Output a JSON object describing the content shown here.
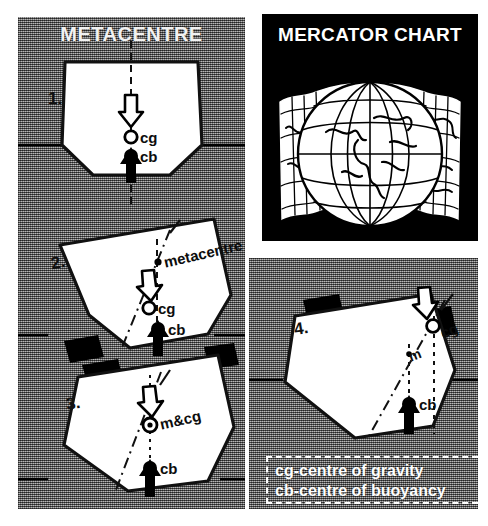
{
  "figure": {
    "background_color": "#ffffff",
    "halftone_gray": "#8a8a8a",
    "ink_color": "#000000"
  },
  "left_panel": {
    "title": "METACENTRE",
    "steps": [
      {
        "number": "1.",
        "state": "upright",
        "labels": {
          "cg": "cg",
          "cb": "cb"
        },
        "icons": [
          "gravity-arrow-down",
          "buoyancy-arrow-up",
          "waterline"
        ]
      },
      {
        "number": "2.",
        "state": "heeled",
        "labels": {
          "metacentre": "metacentre",
          "cg": "cg",
          "cb": "cb"
        },
        "icons": [
          "gravity-arrow-down",
          "buoyancy-arrow-up",
          "waterline",
          "deck-cargo-block"
        ]
      },
      {
        "number": "3.",
        "state": "heeled-neutral",
        "labels": {
          "m_and_cg": "m&cg",
          "cb": "cb"
        },
        "icons": [
          "gravity-arrow-down",
          "buoyancy-arrow-up",
          "waterline",
          "deck-cargo-block"
        ]
      }
    ]
  },
  "mercator_panel": {
    "title": "MERCATOR CHART",
    "illustration": "globe-with-unrolled-mercator-chart",
    "background_color": "#000000",
    "title_color": "#ffffff"
  },
  "right_panel": {
    "step": {
      "number": "4.",
      "state": "heeled-capsizing",
      "labels": {
        "cg": "cg",
        "m": "m",
        "cb": "cb"
      },
      "icons": [
        "gravity-arrow-down",
        "buoyancy-arrow-up",
        "waterline",
        "deck-cargo-block"
      ]
    },
    "legend": {
      "border_color": "#ffffff",
      "lines": [
        "cg-centre of gravity",
        "cb-centre of  buoyancy"
      ]
    }
  }
}
